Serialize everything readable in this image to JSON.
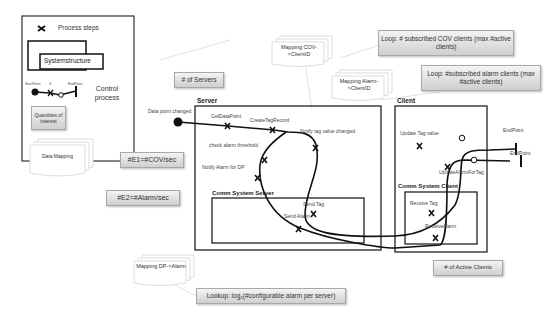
{
  "legend": {
    "process_steps": "Process steps",
    "system_structure": "Systemstructure",
    "control_process": "Control process",
    "startpoint": "StartPoint",
    "step": "X",
    "endpoint": "EndPoint",
    "quantities": "Quantities of interest",
    "data_mapping": "Data Mapping"
  },
  "quantity_boxes": {
    "servers": "# of Servers",
    "e1": "#E1=#COV/sec",
    "e2": "#E2=#Alarm/sec",
    "active_clients": "# of Active Clients",
    "loop_cov": "Loop:  # subscribed COV clients (max #active clients)",
    "loop_alarm": "Loop: #subscribed alarm clients (max #active clients)",
    "lookup": "Lookup: log₂(#configurable alarm per server)"
  },
  "mappings": {
    "cov_client": "Mapping COV->ClientID",
    "alarm_client": "Mapping Alarm->ClientID",
    "dp_alarm": "Mapping DP->Alarm"
  },
  "structures": {
    "server": "Server",
    "client": "Client",
    "comm_server": "Comm System Server",
    "comm_client": "Comm System Client"
  },
  "steps": {
    "data_point_changed": "Data point changed",
    "get_data_point": "GetDataPoint",
    "create_tag_record": "CreateTagRecord",
    "notify_tag": "Notify tag value changed",
    "check_alarm": "check alarm threshold",
    "notify_alarm": "Notify Alarm for DP",
    "send_tag": "Send Tag",
    "send_alarm": "Send Alarm",
    "receive_tag": "Receive Tag",
    "receive_alarm": "ReceiveAlarm",
    "update_tag": "Update Tag value",
    "update_alarm": "UpdateAlarmForTag",
    "endpoint1": "EndPoint",
    "endpoint2": "EndPoint"
  },
  "colors": {
    "line": "#111111",
    "box_top": "#f4f4f4",
    "box_bottom": "#cfcfcf"
  }
}
